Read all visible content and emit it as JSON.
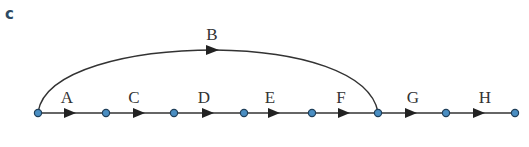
{
  "panel_label": "c",
  "colors": {
    "edge": "#333333",
    "node_fill": "#4a8ec2",
    "node_stroke": "#1f3f5a",
    "panel_label": "#2e4a63"
  },
  "nodes": [
    {
      "id": "n1",
      "x": 38
    },
    {
      "id": "n2",
      "x": 106
    },
    {
      "id": "n3",
      "x": 174
    },
    {
      "id": "n4",
      "x": 244
    },
    {
      "id": "n5",
      "x": 312
    },
    {
      "id": "n6",
      "x": 378
    },
    {
      "id": "n7",
      "x": 446
    },
    {
      "id": "n8",
      "x": 515
    }
  ],
  "edges": [
    {
      "label": "A",
      "from": "n1",
      "to": "n2"
    },
    {
      "label": "C",
      "from": "n2",
      "to": "n3"
    },
    {
      "label": "D",
      "from": "n3",
      "to": "n4"
    },
    {
      "label": "E",
      "from": "n4",
      "to": "n5"
    },
    {
      "label": "F",
      "from": "n5",
      "to": "n6"
    },
    {
      "label": "G",
      "from": "n6",
      "to": "n7"
    },
    {
      "label": "H",
      "from": "n7",
      "to": "n8"
    },
    {
      "label": "B",
      "from": "n1",
      "to": "n6",
      "curved": true
    }
  ]
}
